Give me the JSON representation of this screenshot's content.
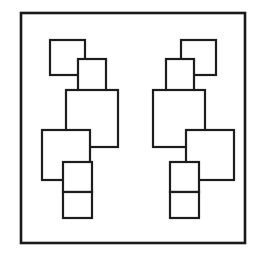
{
  "figure": {
    "title": "Two mirrored clusters of overlapping rectangles",
    "background_color": "#ffffff",
    "line_color": "#1d1d1d",
    "frame_color": "#1a1a1a",
    "canvas": {
      "width": 261,
      "height": 253
    },
    "frame": {
      "name": "outer-frame",
      "x": 21,
      "y": 13,
      "width": 224,
      "height": 230,
      "stroke_width": 2.6
    },
    "clusters": [
      {
        "name": "left-cluster",
        "orientation": "normal",
        "boxes": [
          {
            "name": "box-1-small-square-top",
            "x": 50,
            "y": 40,
            "width": 35,
            "height": 35
          },
          {
            "name": "box-2-tall-upper",
            "x": 78,
            "y": 59,
            "width": 28,
            "height": 37
          },
          {
            "name": "box-3-large-center",
            "x": 66,
            "y": 90,
            "width": 52,
            "height": 57
          },
          {
            "name": "box-4-mid-left",
            "x": 42,
            "y": 130,
            "width": 48,
            "height": 50
          },
          {
            "name": "box-5-lower-small",
            "x": 63,
            "y": 162,
            "width": 29,
            "height": 30
          },
          {
            "name": "box-6-bottom-small",
            "x": 63,
            "y": 192,
            "width": 29,
            "height": 26
          }
        ]
      },
      {
        "name": "right-cluster",
        "orientation": "mirrored",
        "boxes": [
          {
            "name": "box-1-small-square-top",
            "x": 181,
            "y": 40,
            "width": 35,
            "height": 35
          },
          {
            "name": "box-2-tall-upper",
            "x": 166,
            "y": 59,
            "width": 28,
            "height": 37
          },
          {
            "name": "box-3-large-center",
            "x": 153,
            "y": 90,
            "width": 52,
            "height": 57
          },
          {
            "name": "box-4-mid-right",
            "x": 186,
            "y": 130,
            "width": 48,
            "height": 50
          },
          {
            "name": "box-5-lower-small",
            "x": 170,
            "y": 162,
            "width": 29,
            "height": 30
          },
          {
            "name": "box-6-bottom-small",
            "x": 170,
            "y": 192,
            "width": 29,
            "height": 26
          }
        ]
      }
    ]
  }
}
